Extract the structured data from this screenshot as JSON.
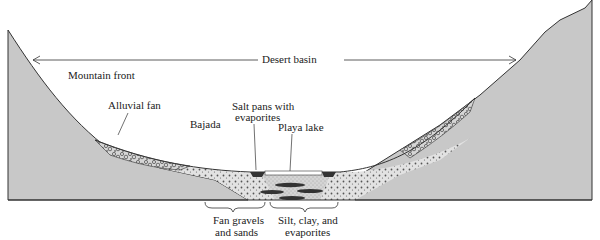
{
  "diagram": {
    "type": "geologic cross-section",
    "labels": {
      "desert_basin": "Desert basin",
      "mountain_front": "Mountain front",
      "alluvial_fan": "Alluvial fan",
      "bajada": "Bajada",
      "salt_pans_line1": "Salt pans with",
      "salt_pans_line2": "evaporites",
      "playa_lake": "Playa lake",
      "fan_gravels_line1": "Fan gravels",
      "fan_gravels_line2": "and sands",
      "silt_line1": "Silt, clay, and",
      "silt_line2": "evaporites"
    },
    "colors": {
      "bedrock": "#c8c8c8",
      "sediment": "#dcdcdc",
      "evaporite": "#333333",
      "line": "#333333"
    }
  }
}
